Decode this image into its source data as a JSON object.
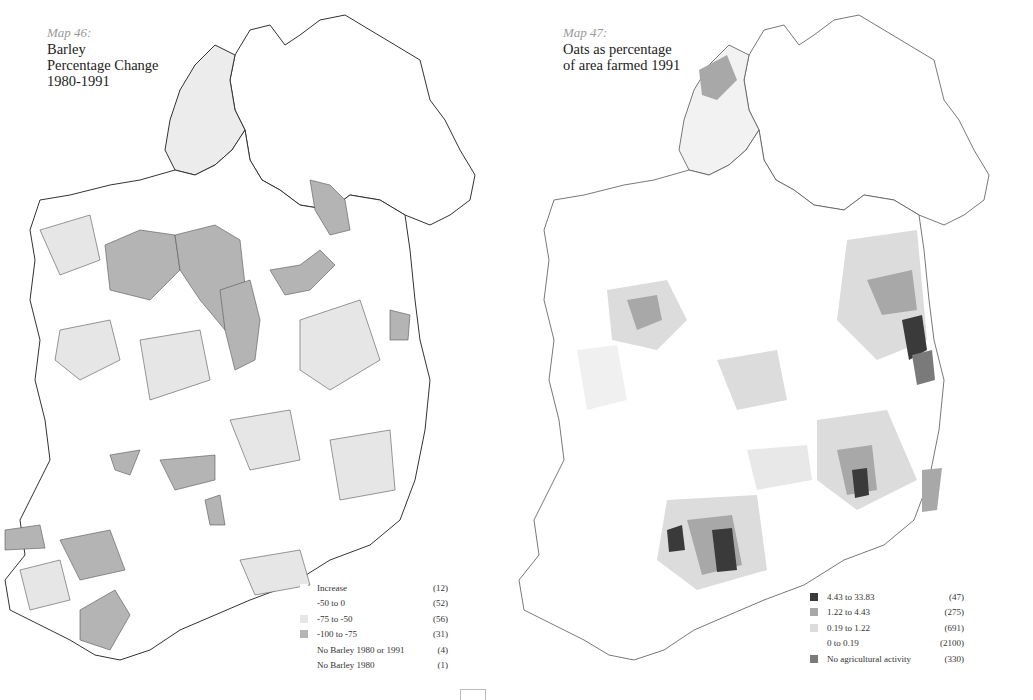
{
  "maps": [
    {
      "map_number": "Map 46:",
      "title_lines": [
        "Barley",
        "Percentage Change",
        "1980-1991"
      ],
      "legend": [
        {
          "label": "Increase",
          "count": "(12)",
          "color": "#ffffff"
        },
        {
          "label": "-50 to 0",
          "count": "(52)",
          "color": "#ffffff"
        },
        {
          "label": "-75 to -50",
          "count": "(56)",
          "color": "#e6e6e6"
        },
        {
          "label": "-100 to -75",
          "count": "(31)",
          "color": "#b4b4b4"
        },
        {
          "label": "No Barley 1980 or 1991",
          "count": "(4)",
          "color": "#ffffff"
        },
        {
          "label": "No Barley 1980",
          "count": "(1)",
          "color": "#ffffff"
        }
      ]
    },
    {
      "map_number": "Map 47:",
      "title_lines": [
        "Oats as percentage",
        "of area farmed 1991"
      ],
      "legend": [
        {
          "label": "4.43 to 33.83",
          "count": "(47)",
          "color": "#3a3a3a"
        },
        {
          "label": "1.22 to 4.43",
          "count": "(275)",
          "color": "#a8a8a8"
        },
        {
          "label": "0.19 to 1.22",
          "count": "(691)",
          "color": "#dcdcdc"
        },
        {
          "label": "0 to 0.19",
          "count": "(2100)",
          "color": "#ffffff"
        },
        {
          "label": "No agricultural activity",
          "count": "(330)",
          "color": "#7a7a7a"
        }
      ]
    }
  ],
  "colors": {
    "outline": "#333333",
    "light_fill": "#e6e6e6",
    "mid_fill": "#b4b4b4",
    "dark_fill": "#3a3a3a"
  }
}
